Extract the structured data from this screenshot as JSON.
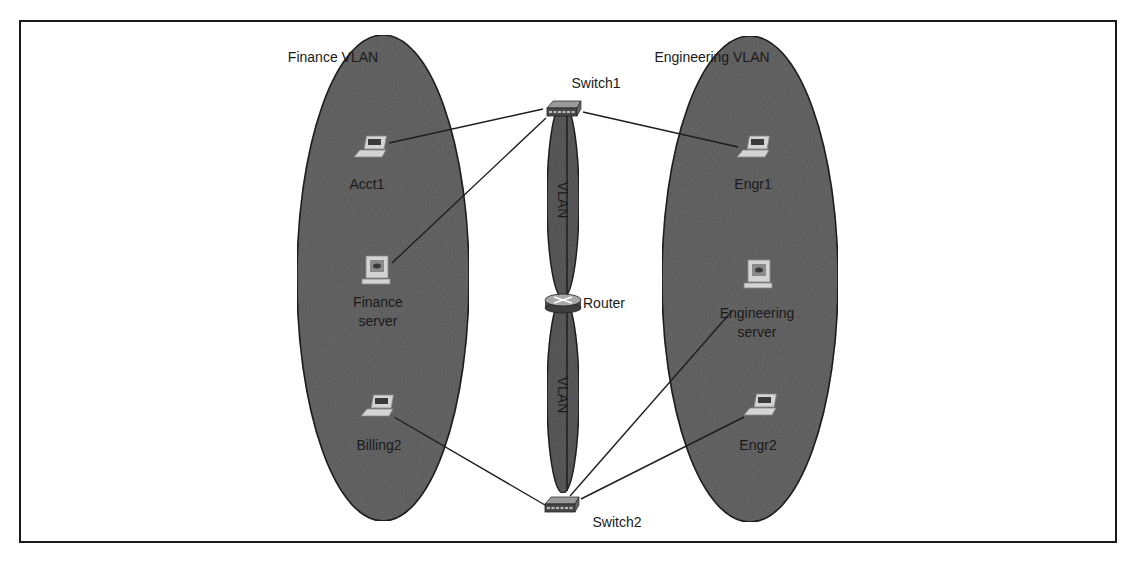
{
  "colors": {
    "frame": "#1a1a1a",
    "vlan_fill": "#6b6b6b",
    "vlan_stroke": "#222222",
    "trunk_fill": "#5e5e5e",
    "link": "#1e1e1e",
    "device_light": "#d4d4d4",
    "device_dark": "#3a3a3a",
    "text": "#1a1a1a"
  },
  "vlans": [
    {
      "id": "finance",
      "label": "Finance VLAN",
      "cx": 383,
      "cy": 278,
      "rx": 86,
      "ry": 243,
      "label_x": 333,
      "label_y": 62
    },
    {
      "id": "engineering",
      "label": "Engineering VLAN",
      "cx": 750,
      "cy": 279,
      "rx": 88,
      "ry": 243,
      "label_x": 712,
      "label_y": 62
    }
  ],
  "trunks": [
    {
      "label": "VLAN",
      "cx": 563,
      "cy": 200,
      "rx": 16,
      "ry": 98
    },
    {
      "label": "VLAN",
      "cx": 563,
      "cy": 395,
      "rx": 16,
      "ry": 98
    }
  ],
  "devices": [
    {
      "id": "switch1",
      "type": "switch",
      "label": "Switch1",
      "x": 562,
      "y": 111,
      "label_x": 596,
      "label_y": 88
    },
    {
      "id": "router",
      "type": "router",
      "label": "Router",
      "x": 563,
      "y": 302,
      "label_x": 604,
      "label_y": 308
    },
    {
      "id": "switch2",
      "type": "switch",
      "label": "Switch2",
      "x": 560,
      "y": 507,
      "label_x": 617,
      "label_y": 527
    },
    {
      "id": "acct1",
      "type": "laptop",
      "label": "Acct1",
      "x": 370,
      "y": 150,
      "label_x": 367,
      "label_y": 189
    },
    {
      "id": "finance-server",
      "type": "server",
      "label_lines": [
        "Finance",
        "server"
      ],
      "x": 376,
      "y": 272,
      "label_x": 378,
      "label_y": 307
    },
    {
      "id": "billing2",
      "type": "laptop",
      "label": "Billing2",
      "x": 377,
      "y": 409,
      "label_x": 379,
      "label_y": 450
    },
    {
      "id": "engr1",
      "type": "laptop",
      "label": "Engr1",
      "x": 753,
      "y": 150,
      "label_x": 753,
      "label_y": 189
    },
    {
      "id": "engineering-server",
      "type": "server",
      "label_lines": [
        "Engineering",
        "server"
      ],
      "x": 758,
      "y": 276,
      "label_x": 757,
      "label_y": 318
    },
    {
      "id": "engr2",
      "type": "laptop",
      "label": "Engr2",
      "x": 760,
      "y": 408,
      "label_x": 758,
      "label_y": 450
    }
  ],
  "links": [
    {
      "from": "acct1",
      "to": "switch1",
      "x1": 389,
      "y1": 143,
      "x2": 543,
      "y2": 109
    },
    {
      "from": "finance-server",
      "to": "switch1",
      "x1": 392,
      "y1": 263,
      "x2": 546,
      "y2": 118
    },
    {
      "from": "engr1",
      "to": "switch1",
      "x1": 738,
      "y1": 147,
      "x2": 583,
      "y2": 112
    },
    {
      "from": "billing2",
      "to": "switch2",
      "x1": 394,
      "y1": 417,
      "x2": 545,
      "y2": 505
    },
    {
      "from": "engineering-server",
      "to": "switch2",
      "x1": 732,
      "y1": 311,
      "x2": 570,
      "y2": 496
    },
    {
      "from": "engr2",
      "to": "switch2",
      "x1": 744,
      "y1": 417,
      "x2": 581,
      "y2": 499
    }
  ]
}
